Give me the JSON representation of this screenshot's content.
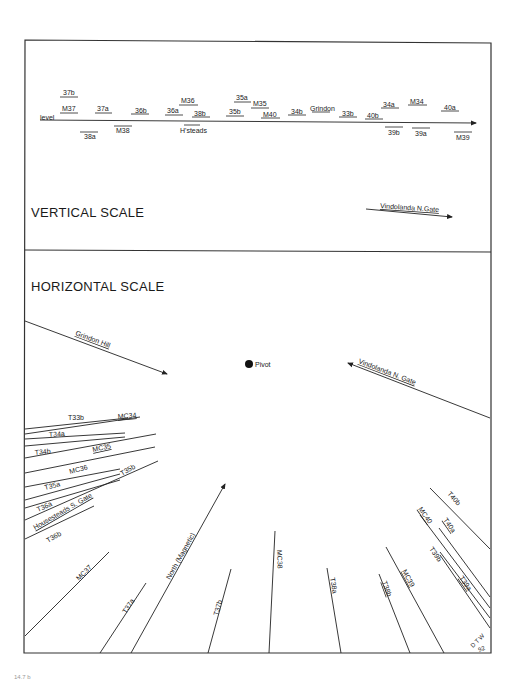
{
  "vertical_panel": {
    "heading": "VERTICAL SCALE",
    "axis_start_label": "level",
    "above_labels": [
      {
        "text": "37b",
        "x": 63,
        "y": 95
      },
      {
        "text": "M37",
        "x": 62,
        "y": 111
      },
      {
        "text": "37a",
        "x": 97,
        "y": 111
      },
      {
        "text": "36b",
        "x": 134,
        "y": 112
      },
      {
        "text": "M36",
        "x": 181,
        "y": 103
      },
      {
        "text": "36a",
        "x": 166,
        "y": 112
      },
      {
        "text": "38b",
        "x": 193,
        "y": 115
      },
      {
        "text": "35a",
        "x": 236,
        "y": 100
      },
      {
        "text": "M35",
        "x": 253,
        "y": 105
      },
      {
        "text": "35b",
        "x": 229,
        "y": 113
      },
      {
        "text": "M40",
        "x": 262,
        "y": 116
      },
      {
        "text": "34b",
        "x": 290,
        "y": 113
      },
      {
        "text": "Grindon",
        "x": 309,
        "y": 111
      },
      {
        "text": "33b",
        "x": 341,
        "y": 115
      },
      {
        "text": "40b",
        "x": 366,
        "y": 117
      },
      {
        "text": "34a",
        "x": 383,
        "y": 107
      },
      {
        "text": "M34",
        "x": 410,
        "y": 104
      },
      {
        "text": "40a",
        "x": 444,
        "y": 110
      }
    ],
    "below_labels": [
      {
        "text": "38a",
        "x": 83,
        "y": 138
      },
      {
        "text": "M38",
        "x": 116,
        "y": 132
      },
      {
        "text": "H'steads",
        "x": 181,
        "y": 132
      },
      {
        "text": "39b",
        "x": 387,
        "y": 134
      },
      {
        "text": "39a",
        "x": 414,
        "y": 135
      },
      {
        "text": "M39",
        "x": 455,
        "y": 139
      }
    ],
    "legend_label": "Vindolanda  N.Gate"
  },
  "horizontal_panel": {
    "heading": "HORIZONTAL SCALE",
    "pivot_label": "Pivot",
    "arrows": {
      "grindon_hill": "Grindon  Hill",
      "vindolanda_n_gate": "Vindolanda  N. Gate",
      "north": "North (Magnetic)"
    },
    "left_fan_labels": {
      "t33b": "T33b",
      "mc34": "MC34",
      "t34a": "T34a",
      "t34b": "T34b",
      "mc35": "MC35",
      "mc36": "MC36",
      "t35a": "T35a",
      "t35b": "T35b",
      "t36a": "T36a",
      "housesteads_s_gate": "Housesteads  S. Gate",
      "t36b": "T36b"
    },
    "bottom_fan_labels": {
      "mc37": "MC37",
      "t37a": "T37a",
      "t37b": "T37b",
      "mc38": "MC38",
      "t38a": "T38a",
      "t38b": "T38b",
      "mc39": "MC39",
      "t39b": "T39b",
      "t39a": "T39a",
      "mc40": "MC40",
      "t40a": "T40a",
      "t40b": "T40b"
    },
    "signature": {
      "initials": "D T W",
      "year": "92"
    }
  },
  "footnote": "14.7 b"
}
